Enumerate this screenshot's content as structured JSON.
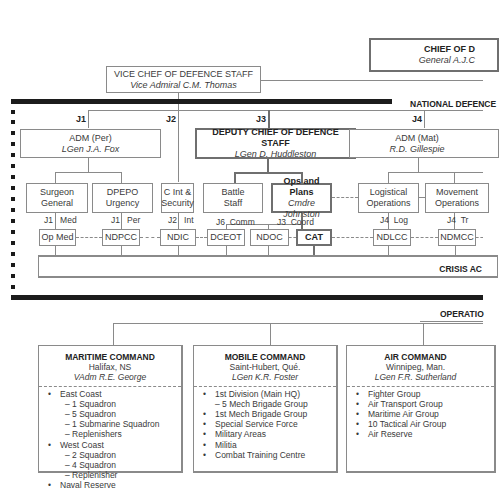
{
  "top": {
    "cds": {
      "title": "CHIEF OF D",
      "name": "General A.J.C"
    },
    "vcds": {
      "title": "VICE CHEF OF DEFENCE STAFF",
      "name": "Vice Admiral C.M. Thomas"
    }
  },
  "ndhq": {
    "section_label": "NATIONAL DEFENCE",
    "j_labels": [
      "J1",
      "J2",
      "J3",
      "J4"
    ],
    "adm_per": {
      "title": "ADM (Per)",
      "name": "LGen J.A. Fox"
    },
    "dcds": {
      "title": "DEPUTY CHIEF OF DEFENCE STAFF",
      "name": "LGen D. Huddleston"
    },
    "adm_mat": {
      "title": "ADM (Mat)",
      "name": "R.D. Gillespie"
    },
    "branches": [
      {
        "line1": "Surgeon",
        "line2": "General"
      },
      {
        "line1": "DPEPO",
        "line2": "Urgency"
      },
      {
        "line1": "C Int &",
        "line2": "Security"
      },
      {
        "line1": "Battle",
        "line2": "Staff"
      },
      {
        "line1": "Ops and Plans",
        "line2": "Cmdre Johnston"
      },
      {
        "line1": "Logistical",
        "line2": "Operations"
      },
      {
        "line1": "Movement",
        "line2": "Operations"
      }
    ],
    "centres": [
      {
        "name": "Op Med",
        "tag_a": "J1",
        "tag_b": "Med"
      },
      {
        "name": "NDPCC",
        "tag_a": "J1",
        "tag_b": "Per"
      },
      {
        "name": "NDIC",
        "tag_a": "J2",
        "tag_b": "Int"
      },
      {
        "name": "DCEOT",
        "tag_a": "J6",
        "tag_b": "Comm"
      },
      {
        "name": "NDOC",
        "tag_a": "",
        "tag_b": ""
      },
      {
        "name": "CAT",
        "tag_a": "J3",
        "tag_b": "Coord"
      },
      {
        "name": "NDLCC",
        "tag_a": "J4",
        "tag_b": "Log"
      },
      {
        "name": "NDMCC",
        "tag_a": "J4",
        "tag_b": "Tr"
      }
    ],
    "crisis_label": "CRISIS AC"
  },
  "operations": {
    "section_label": "OPERATIO",
    "commands": [
      {
        "title": "MARITIME COMMAND",
        "location": "Halifax, NS",
        "commander": "VAdm R.E. George",
        "items": [
          {
            "text": "East Coast",
            "level": 0
          },
          {
            "text": "– 1 Squadron",
            "level": 1
          },
          {
            "text": "– 5 Squadron",
            "level": 1
          },
          {
            "text": "– 1 Submarine Squadron",
            "level": 1
          },
          {
            "text": "– Replenishers",
            "level": 1
          },
          {
            "text": "West Coast",
            "level": 0
          },
          {
            "text": "– 2 Squadron",
            "level": 1
          },
          {
            "text": "– 4 Squadron",
            "level": 1
          },
          {
            "text": "– Replenisher",
            "level": 1
          },
          {
            "text": "Naval Reserve",
            "level": 0
          }
        ]
      },
      {
        "title": "MOBILE COMMAND",
        "location": "Saint-Hubert, Qué.",
        "commander": "LGen K.R. Foster",
        "items": [
          {
            "text": "1st Division (Main HQ)",
            "level": 0
          },
          {
            "text": "– 5 Mech Brigade Group",
            "level": 1
          },
          {
            "text": "1st Mech Brigade Group",
            "level": 0
          },
          {
            "text": "Special Service Force",
            "level": 0
          },
          {
            "text": "Military Areas",
            "level": 0
          },
          {
            "text": "Militia",
            "level": 0
          },
          {
            "text": "Combat Training Centre",
            "level": 0
          }
        ]
      },
      {
        "title": "AIR COMMAND",
        "location": "Winnipeg, Man.",
        "commander": "LGen F.R. Sutherland",
        "items": [
          {
            "text": "Fighter Group",
            "level": 0
          },
          {
            "text": "Air Transport Group",
            "level": 0
          },
          {
            "text": "Maritime Air Group",
            "level": 0
          },
          {
            "text": "10 Tactical Air Group",
            "level": 0
          },
          {
            "text": "Air Reserve",
            "level": 0
          }
        ]
      }
    ]
  }
}
